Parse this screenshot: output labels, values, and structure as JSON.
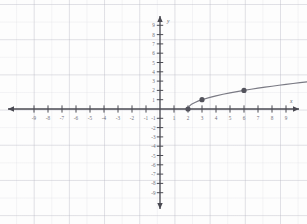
{
  "figure": {
    "kind": "coordinate-plane-graph",
    "background_color": "#fdfdfd",
    "grid_color": "#aaaab9",
    "axis_color": "#4a4a52",
    "curve_color": "#7a7a84",
    "point_color": "#53535c"
  },
  "axes": {
    "x_axis_label": "x",
    "y_axis_label": "y",
    "x_tick_labels": [
      "-9",
      "-8",
      "-7",
      "-6",
      "-5",
      "-4",
      "-3",
      "-2",
      "-1",
      "1",
      "2",
      "3",
      "4",
      "5",
      "6",
      "7",
      "8",
      "9"
    ],
    "y_tick_labels": [
      "9",
      "8",
      "7",
      "6",
      "5",
      "4",
      "3",
      "2",
      "1",
      "-1",
      "-2",
      "-3",
      "-4",
      "-5",
      "-6",
      "-7",
      "-8",
      "-9"
    ],
    "origin_label": ""
  },
  "chart_data": {
    "type": "line",
    "title": "",
    "xlabel": "x",
    "ylabel": "y",
    "xlim": [
      -10,
      10.5
    ],
    "ylim": [
      -10,
      10
    ],
    "grid": true,
    "legend": "none",
    "x_ticks": [
      -9,
      -8,
      -7,
      -6,
      -5,
      -4,
      -3,
      -2,
      -1,
      1,
      2,
      3,
      4,
      5,
      6,
      7,
      8,
      9
    ],
    "y_ticks": [
      9,
      8,
      7,
      6,
      5,
      4,
      3,
      2,
      1,
      -1,
      -2,
      -3,
      -4,
      -5,
      -6,
      -7,
      -8,
      -9
    ],
    "series": [
      {
        "name": "y = sqrt(x - 2)",
        "x": [
          2.0,
          2.1,
          2.25,
          2.5,
          2.75,
          3.0,
          3.5,
          4.0,
          4.5,
          5.0,
          5.5,
          6.0,
          6.5,
          7.0,
          7.5,
          8.0,
          8.5,
          9.0,
          9.5,
          10.0,
          10.5
        ],
        "values": [
          0.0,
          0.32,
          0.5,
          0.71,
          0.87,
          1.0,
          1.22,
          1.41,
          1.58,
          1.73,
          1.87,
          2.0,
          2.12,
          2.24,
          2.35,
          2.45,
          2.55,
          2.65,
          2.74,
          2.83,
          2.92
        ]
      }
    ],
    "marked_points": [
      {
        "label": "(2, 0)",
        "x": 2,
        "y": 0
      },
      {
        "label": "(3, 1)",
        "x": 3,
        "y": 1
      },
      {
        "label": "(6, 2)",
        "x": 6,
        "y": 2
      }
    ]
  }
}
